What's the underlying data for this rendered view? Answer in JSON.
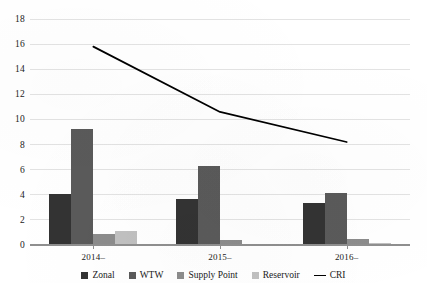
{
  "chart_data": {
    "type": "bar",
    "title": "",
    "subtitle": "",
    "xlabel": "",
    "ylabel": "",
    "categories": [
      "2014–",
      "2015–",
      "2016–"
    ],
    "ylim": [
      0,
      18
    ],
    "ytick_step": 2,
    "yticks": [
      0,
      2,
      4,
      6,
      8,
      10,
      12,
      14,
      16,
      18
    ],
    "ytick_labels": [
      "0",
      "2",
      "4",
      "6",
      "8",
      "10",
      "12",
      "14",
      "16",
      "18"
    ],
    "grid": true,
    "legend_position": "bottom",
    "series": [
      {
        "name": "Zonal",
        "type": "bar",
        "color": "#333333",
        "values": [
          4.0,
          3.6,
          3.3
        ]
      },
      {
        "name": "WTW",
        "type": "bar",
        "color": "#5a5a5a",
        "values": [
          9.2,
          6.2,
          4.1
        ]
      },
      {
        "name": "Supply Point",
        "type": "bar",
        "color": "#8c8c8c",
        "values": [
          0.8,
          0.3,
          0.4
        ]
      },
      {
        "name": "Reservoir",
        "type": "bar",
        "color": "#c0c0c0",
        "values": [
          1.0,
          0.0,
          0.1
        ]
      },
      {
        "name": "CRI",
        "type": "line",
        "color": "#000000",
        "values": [
          15.8,
          10.6,
          8.2
        ]
      }
    ]
  },
  "legend": {
    "items": [
      {
        "label": "Zonal",
        "marker": "swatch",
        "color": "#333333"
      },
      {
        "label": "WTW",
        "marker": "swatch",
        "color": "#5a5a5a"
      },
      {
        "label": "Supply Point",
        "marker": "swatch",
        "color": "#8c8c8c"
      },
      {
        "label": "Reservoir",
        "marker": "swatch",
        "color": "#c0c0c0"
      },
      {
        "label": "CRI",
        "marker": "line",
        "color": "#000000"
      }
    ]
  },
  "cropped_text_top": ""
}
